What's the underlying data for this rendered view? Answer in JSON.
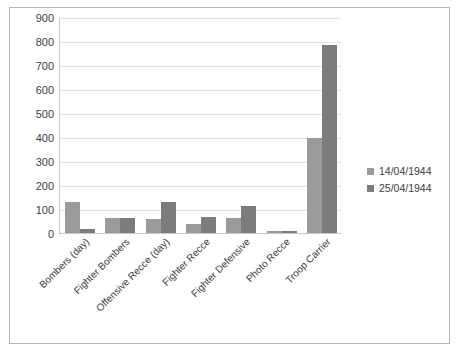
{
  "chart_data": {
    "type": "bar",
    "title": "",
    "subtitle": "",
    "xlabel": "",
    "ylabel": "",
    "ylim": [
      0,
      900
    ],
    "ytick_step": 100,
    "yticks": [
      900,
      800,
      700,
      600,
      500,
      400,
      300,
      200,
      100,
      0
    ],
    "grid": true,
    "legend_position": "right",
    "categories": [
      "Bombers (day)",
      "Fighter Bombers",
      "Offensive Recce (day)",
      "Fighter Recce",
      "Fighter Defensive",
      "Photo Recce",
      "Troop Carrier"
    ],
    "series": [
      {
        "name": "14/04/1944",
        "color": "#9b9b9b",
        "values": [
          130,
          62,
          60,
          38,
          62,
          8,
          395
        ]
      },
      {
        "name": "25/04/1944",
        "color": "#7c7c7c",
        "values": [
          15,
          62,
          128,
          65,
          112,
          10,
          785
        ]
      }
    ]
  },
  "legend": {
    "items": [
      {
        "label": "14/04/1944",
        "color": "#9b9b9b"
      },
      {
        "label": "25/04/1944",
        "color": "#7c7c7c"
      }
    ]
  },
  "colors": {
    "series1": "#9b9b9b",
    "series2": "#7c7c7c",
    "gridline": "#e2e2e2",
    "axis": "#c9c9c9",
    "frame_border": "#b8b8b8",
    "text": "#3d3d3d",
    "background": "#ffffff"
  }
}
